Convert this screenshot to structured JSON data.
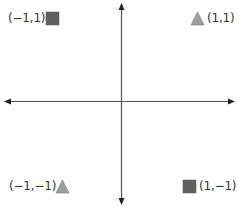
{
  "diagram": {
    "title": "",
    "axes": {
      "origin": {
        "x": 121,
        "y": 101
      },
      "horizontal": {
        "x1": 5,
        "x2": 234,
        "arrows": "both"
      },
      "vertical": {
        "y1": 3,
        "y2": 204,
        "arrows": "both"
      },
      "color": "#222222"
    },
    "points": [
      {
        "id": "top-left",
        "label": "(−1,1)",
        "coords": [
          -1,
          1
        ],
        "shape": "square",
        "color": "#616161"
      },
      {
        "id": "top-right",
        "label": "(1,1)",
        "coords": [
          1,
          1
        ],
        "shape": "triangle",
        "color": "#9e9e9e"
      },
      {
        "id": "bottom-left",
        "label": "(−1,−1)",
        "coords": [
          -1,
          -1
        ],
        "shape": "triangle",
        "color": "#9e9e9e"
      },
      {
        "id": "bottom-right",
        "label": "(1,−1)",
        "coords": [
          1,
          -1
        ],
        "shape": "square",
        "color": "#616161"
      }
    ]
  }
}
